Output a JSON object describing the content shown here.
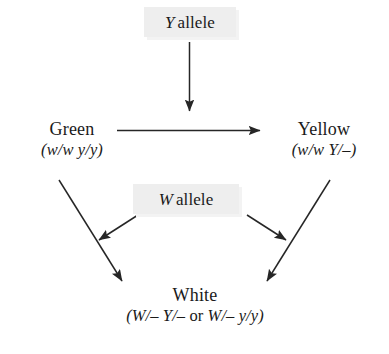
{
  "diagram": {
    "type": "flow-diagram",
    "background_color": "#ffffff",
    "text_color": "#1a1a1a",
    "box_fill_color": "#eeeeee",
    "box_shadow_color": "#f3f3f3",
    "arrow_color": "#262626"
  },
  "allele_boxes": {
    "y_allele": {
      "gene": "Y",
      "label": "allele",
      "full_text": "Y allele"
    },
    "w_allele": {
      "gene": "W",
      "label": "allele",
      "full_text": "W allele"
    }
  },
  "nodes": {
    "green": {
      "phenotype": "Green",
      "genotype": "(w/w y/y)",
      "genotype_parts": {
        "open": "(",
        "locus1": "w/w",
        "space": " ",
        "locus2": "y/y",
        "close": ")"
      }
    },
    "yellow": {
      "phenotype": "Yellow",
      "genotype": "(w/w Y/–)",
      "genotype_parts": {
        "open": "(",
        "locus1": "w/w",
        "space": " ",
        "locus2": "Y/–",
        "close": ")"
      }
    },
    "white": {
      "phenotype": "White",
      "genotype": "(W/– Y/– or W/– y/y)",
      "genotype_parts": {
        "open": "(",
        "option1": "W/– Y/–",
        "conjunction": " or ",
        "option2": "W/– y/y",
        "close": ")"
      }
    }
  },
  "arrows": [
    {
      "name": "y-allele-to-green-yellow-transition",
      "from": "y_allele_box",
      "to": "green-to-yellow-arrow",
      "direction": "down"
    },
    {
      "name": "green-to-yellow",
      "from": "green",
      "to": "yellow",
      "direction": "right"
    },
    {
      "name": "green-to-white",
      "from": "green",
      "to": "white",
      "direction": "down-right"
    },
    {
      "name": "yellow-to-white",
      "from": "yellow",
      "to": "white",
      "direction": "down-left"
    },
    {
      "name": "w-allele-to-green-white-transition",
      "from": "w_allele_box",
      "to": "green-to-white-arrow",
      "direction": "down-left"
    },
    {
      "name": "w-allele-to-yellow-white-transition",
      "from": "w_allele_box",
      "to": "yellow-to-white-arrow",
      "direction": "down-right"
    }
  ]
}
